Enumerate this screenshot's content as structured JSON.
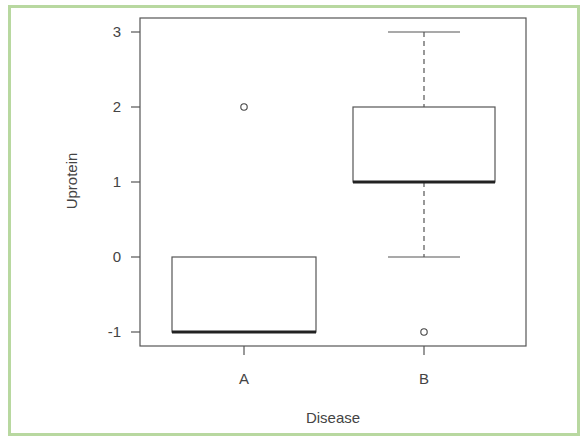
{
  "chart_data": {
    "type": "box",
    "title": "",
    "xlabel": "Disease",
    "ylabel": "Uprotein",
    "categories": [
      "A",
      "B"
    ],
    "ylim": [
      -1.2,
      3.2
    ],
    "yticks": [
      -1,
      0,
      1,
      2,
      3
    ],
    "ytick_labels": [
      "-1",
      "0",
      "1",
      "2",
      "3"
    ],
    "boxes": [
      {
        "name": "A",
        "whisker_low": -1,
        "q1": -1,
        "median": -1,
        "q3": 0,
        "whisker_high": 0,
        "outliers": [
          2
        ]
      },
      {
        "name": "B",
        "whisker_low": 0,
        "q1": 1,
        "median": 1,
        "q3": 2,
        "whisker_high": 3,
        "outliers": [
          -1
        ]
      }
    ],
    "grid": false,
    "legend": null
  },
  "colors": {
    "frame": "#b8d8a0",
    "axis": "#555555",
    "median": "#222222"
  }
}
